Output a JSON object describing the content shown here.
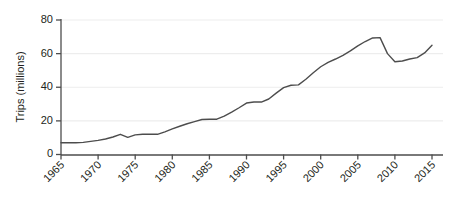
{
  "chart_data": {
    "type": "line",
    "title": "",
    "subtitle": "",
    "xlabel": "",
    "ylabel": "Trips (millions)",
    "xlim": [
      1965,
      2015
    ],
    "ylim": [
      0,
      80
    ],
    "grid": true,
    "grid_axis": "y",
    "legend": false,
    "legend_position": "none",
    "annotations": [],
    "x_ticks": [
      1965,
      1970,
      1975,
      1980,
      1985,
      1990,
      1995,
      2000,
      2005,
      2010,
      2015
    ],
    "x_tick_labels": [
      "1965",
      "1970",
      "1975",
      "1980",
      "1985",
      "1990",
      "1995",
      "2000",
      "2005",
      "2010",
      "2015"
    ],
    "y_ticks": [
      0,
      20,
      40,
      60,
      80
    ],
    "y_tick_labels": [
      "0",
      "20",
      "40",
      "60",
      "80"
    ],
    "series": [
      {
        "name": "Trips",
        "color": "#4d4d4d",
        "x": [
          1965,
          1966,
          1967,
          1968,
          1969,
          1970,
          1971,
          1972,
          1973,
          1974,
          1975,
          1976,
          1977,
          1978,
          1979,
          1980,
          1981,
          1982,
          1983,
          1984,
          1985,
          1986,
          1987,
          1988,
          1989,
          1990,
          1991,
          1992,
          1993,
          1994,
          1995,
          1996,
          1997,
          1998,
          1999,
          2000,
          2001,
          2002,
          2003,
          2004,
          2005,
          2006,
          2007,
          2008,
          2009,
          2010,
          2011,
          2012,
          2013,
          2014,
          2015
        ],
        "y": [
          7.0,
          7.0,
          7.0,
          7.2,
          7.8,
          8.4,
          9.2,
          10.4,
          12.0,
          10.2,
          11.7,
          12.0,
          12.0,
          12.0,
          13.5,
          15.2,
          16.8,
          18.3,
          19.6,
          20.8,
          21.0,
          21.0,
          22.8,
          25.2,
          27.8,
          30.6,
          31.2,
          31.2,
          33.0,
          36.5,
          39.8,
          41.2,
          41.4,
          44.8,
          48.6,
          52.2,
          54.8,
          56.8,
          59.0,
          61.6,
          64.6,
          67.2,
          69.3,
          69.5,
          60.0,
          55.2,
          55.6,
          56.8,
          57.6,
          60.4,
          65.0
        ]
      }
    ]
  },
  "axes": {
    "y_axis_title": "Trips (millions)"
  }
}
